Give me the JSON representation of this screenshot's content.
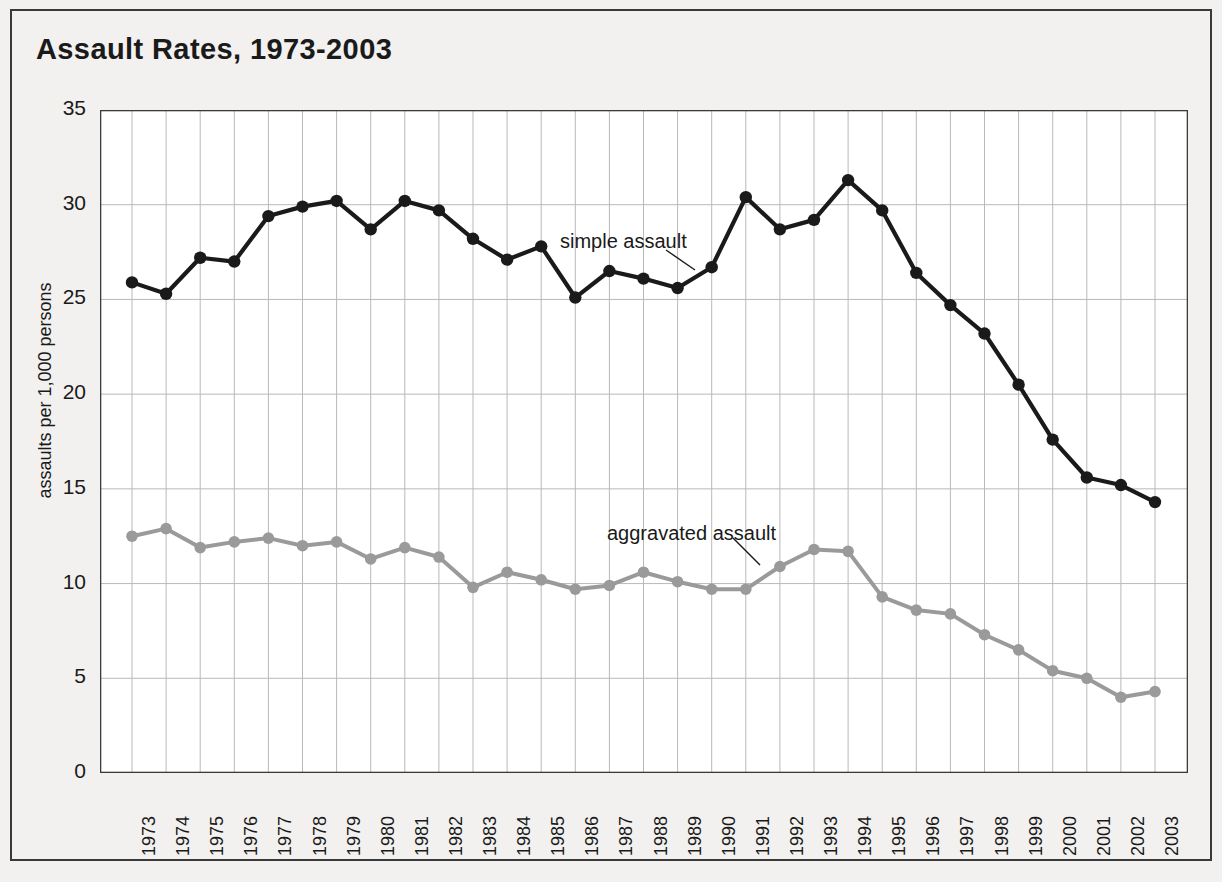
{
  "figure": {
    "title": "Assault Rates, 1973-2003",
    "background_color": "#f2f1ef",
    "border_color": "#3a3a3a"
  },
  "annotations": [
    {
      "name": "simple-assault-label",
      "text": "simple assault"
    },
    {
      "name": "aggravated-assault-label",
      "text": "aggravated assault"
    }
  ],
  "chart_data": {
    "type": "line",
    "title": "Assault Rates, 1973-2003",
    "xlabel": "",
    "ylabel": "assaults per 1,000 persons",
    "ylim": [
      0,
      35
    ],
    "ytick_values": [
      0,
      5,
      10,
      15,
      20,
      25,
      30,
      35
    ],
    "ytick_labels": [
      "0",
      "5",
      "10",
      "15",
      "20",
      "25",
      "30",
      "35"
    ],
    "grid": true,
    "legend_position": "inline-annotations",
    "categories": [
      "1973",
      "1974",
      "1975",
      "1976",
      "1977",
      "1978",
      "1979",
      "1980",
      "1981",
      "1982",
      "1983",
      "1984",
      "1985",
      "1986",
      "1987",
      "1988",
      "1989",
      "1990",
      "1991",
      "1992",
      "1993",
      "1994",
      "1995",
      "1996",
      "1997",
      "1998",
      "1999",
      "2000",
      "2001",
      "2002",
      "2003"
    ],
    "series": [
      {
        "name": "simple assault",
        "color": "#1a1a1a",
        "marker": "circle",
        "values": [
          25.9,
          25.3,
          27.2,
          27.0,
          29.4,
          29.9,
          30.2,
          28.7,
          30.2,
          29.7,
          28.2,
          27.1,
          27.8,
          25.1,
          26.5,
          26.1,
          25.6,
          26.7,
          30.4,
          28.7,
          29.2,
          31.3,
          29.7,
          26.4,
          24.7,
          23.2,
          20.5,
          17.6,
          15.6,
          15.2,
          14.3
        ]
      },
      {
        "name": "aggravated assault",
        "color": "#9a9a9a",
        "marker": "circle",
        "values": [
          12.5,
          12.9,
          11.9,
          12.2,
          12.4,
          12.0,
          12.2,
          11.3,
          11.9,
          11.4,
          9.8,
          10.6,
          10.2,
          9.7,
          9.9,
          10.6,
          10.1,
          9.7,
          9.7,
          10.9,
          11.8,
          11.7,
          9.3,
          8.6,
          8.4,
          7.3,
          6.5,
          5.4,
          5.0,
          4.0,
          4.3
        ]
      }
    ]
  }
}
